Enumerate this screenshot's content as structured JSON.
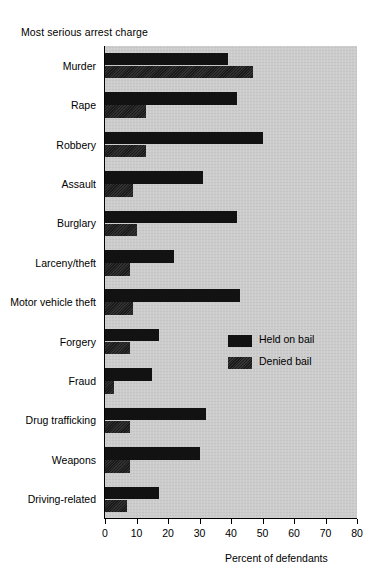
{
  "chart_data": {
    "type": "bar",
    "orientation": "horizontal",
    "title": "Most serious arrest charge",
    "xlabel": "Percent of defendants",
    "ylabel": "",
    "xlim": [
      0,
      80
    ],
    "xticks": [
      0,
      10,
      20,
      30,
      40,
      50,
      60,
      70,
      80
    ],
    "xticklabels": [
      "0",
      "10",
      "20",
      "30",
      "40",
      "50",
      "60",
      "70",
      "80"
    ],
    "grid": false,
    "legend_position": "center-right",
    "categories": [
      "Murder",
      "Rape",
      "Robbery",
      "Assault",
      "Burglary",
      "Larceny/theft",
      "Motor vehicle theft",
      "Forgery",
      "Fraud",
      "Drug trafficking",
      "Weapons",
      "Driving-related"
    ],
    "series": [
      {
        "name": "Held on bail",
        "color": "#121212",
        "values": [
          39,
          42,
          50,
          31,
          42,
          22,
          43,
          17,
          15,
          32,
          30,
          17
        ]
      },
      {
        "name": "Denied bail",
        "color": "#1a1a1a",
        "values": [
          47,
          13,
          13,
          9,
          10,
          8,
          9,
          8,
          3,
          8,
          8,
          7
        ]
      }
    ]
  },
  "legend": {
    "items": [
      {
        "label": "Held on bail"
      },
      {
        "label": "Denied bail"
      }
    ]
  },
  "colors": {
    "plot_background": "#cccccc",
    "bar_held": "#121212",
    "bar_denied": "#1a1a1a",
    "axis": "#000000",
    "page_background": "#ffffff"
  }
}
